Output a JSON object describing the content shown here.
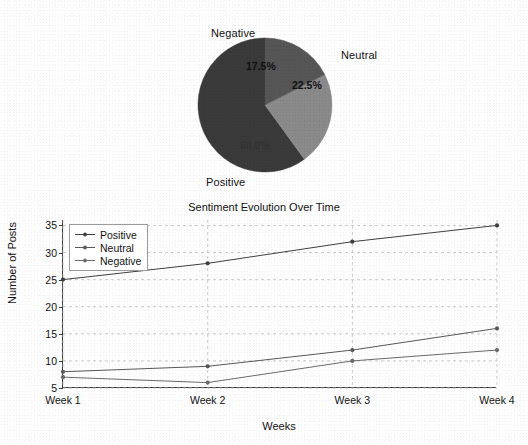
{
  "chart_data": [
    {
      "type": "pie",
      "title": "",
      "labels": [
        "Positive",
        "Neutral",
        "Negative"
      ],
      "values": [
        60.0,
        22.5,
        17.5
      ],
      "value_labels": [
        "60.0%",
        "22.5%",
        "17.5%"
      ],
      "colors": [
        "#3a3a3a",
        "#8a8a8a",
        "#565656"
      ],
      "start_angle_deg": 90,
      "direction": "counterclockwise",
      "legend": "none",
      "outside_labels": {
        "negative": "Negative",
        "neutral": "Neutral",
        "positive": "Positive"
      }
    },
    {
      "type": "line",
      "title": "Sentiment Evolution Over Time",
      "xlabel": "Weeks",
      "ylabel": "Number of Posts",
      "categories": [
        "Week 1",
        "Week 2",
        "Week 3",
        "Week 4"
      ],
      "yticks": [
        5,
        10,
        15,
        20,
        25,
        30,
        35
      ],
      "ylim": [
        5,
        36
      ],
      "grid": true,
      "legend_position": "upper left",
      "series": [
        {
          "name": "Positive",
          "values": [
            25,
            28,
            32,
            35
          ],
          "color": "#3f3f3f"
        },
        {
          "name": "Neutral",
          "values": [
            8,
            9,
            12,
            16
          ],
          "color": "#585858"
        },
        {
          "name": "Negative",
          "values": [
            7,
            6,
            10,
            12
          ],
          "color": "#6a6a6a"
        }
      ]
    }
  ]
}
